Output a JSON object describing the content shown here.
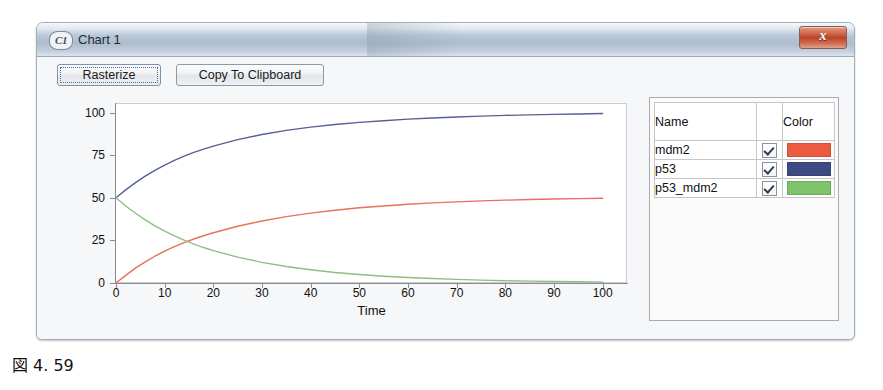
{
  "window": {
    "app_badge": "C1",
    "title": "Chart 1",
    "close_label": "x"
  },
  "toolbar": {
    "rasterize_label": "Rasterize",
    "copy_label": "Copy To Clipboard"
  },
  "legend": {
    "headers": {
      "name": "Name",
      "color": "Color"
    },
    "rows": [
      {
        "name": "mdm2",
        "checked": "true",
        "color": "#ec5b3f"
      },
      {
        "name": "p53",
        "checked": "true",
        "color": "#3e4a84"
      },
      {
        "name": "p53_mdm2",
        "checked": "true",
        "color": "#7ec36c"
      }
    ]
  },
  "caption": {
    "text": "図 4. 59"
  },
  "chart_data": {
    "type": "line",
    "title": "",
    "xlabel": "Time",
    "ylabel": "",
    "xlim": [
      0,
      105
    ],
    "ylim": [
      0,
      105
    ],
    "xticks": [
      0,
      10,
      20,
      30,
      40,
      50,
      60,
      70,
      80,
      90,
      100
    ],
    "yticks": [
      0,
      25,
      50,
      75,
      100
    ],
    "grid": false,
    "legend_position": "right-panel",
    "series": [
      {
        "name": "mdm2",
        "color": "#e8705c",
        "x": [
          0,
          2,
          4,
          6,
          8,
          10,
          12,
          14,
          16,
          18,
          20,
          25,
          30,
          35,
          40,
          45,
          50,
          55,
          60,
          65,
          70,
          75,
          80,
          85,
          90,
          95,
          100
        ],
        "values": [
          0,
          4.5,
          8.7,
          12.4,
          15.7,
          18.7,
          21.3,
          23.7,
          25.8,
          27.7,
          29.5,
          33.3,
          36.4,
          38.9,
          41.0,
          42.7,
          44.1,
          45.2,
          46.2,
          47.0,
          47.6,
          48.2,
          48.6,
          49.0,
          49.3,
          49.5,
          49.7
        ]
      },
      {
        "name": "p53",
        "color": "#555f99",
        "x": [
          0,
          2,
          4,
          6,
          8,
          10,
          12,
          14,
          16,
          18,
          20,
          25,
          30,
          35,
          40,
          45,
          50,
          55,
          60,
          65,
          70,
          75,
          80,
          85,
          90,
          95,
          100
        ],
        "values": [
          50,
          54.6,
          58.9,
          62.7,
          66.1,
          69.2,
          71.9,
          74.4,
          76.6,
          78.5,
          80.3,
          84.1,
          87.1,
          89.5,
          91.4,
          93.0,
          94.2,
          95.2,
          96.1,
          96.8,
          97.4,
          97.9,
          98.3,
          98.6,
          98.9,
          99.1,
          99.4
        ]
      },
      {
        "name": "p53_mdm2",
        "color": "#8cbf84",
        "x": [
          0,
          2,
          4,
          6,
          8,
          10,
          12,
          14,
          16,
          18,
          20,
          25,
          30,
          35,
          40,
          45,
          50,
          55,
          60,
          65,
          70,
          75,
          80,
          85,
          90,
          95,
          100
        ],
        "values": [
          50,
          45.2,
          40.9,
          37.0,
          33.5,
          30.4,
          27.6,
          25.1,
          22.8,
          20.8,
          19.0,
          15.2,
          12.1,
          9.7,
          7.8,
          6.2,
          5.0,
          4.0,
          3.2,
          2.6,
          2.1,
          1.7,
          1.3,
          1.1,
          0.9,
          0.7,
          0.5
        ]
      }
    ]
  }
}
